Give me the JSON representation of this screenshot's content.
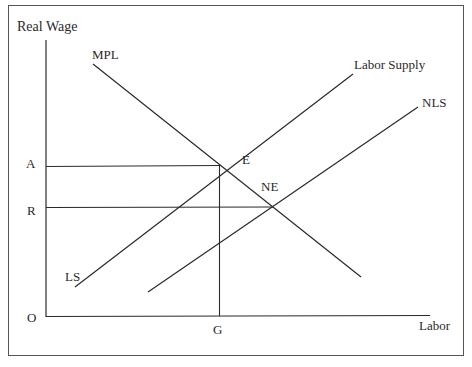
{
  "diagram": {
    "type": "labor-market supply-demand diagram",
    "axes": {
      "y_label": "Real Wage",
      "x_label": "Labor",
      "origin_label": "O"
    },
    "curves": [
      {
        "name": "MPL",
        "label": "MPL",
        "description": "marginal product of labor (labor demand), downward sloping"
      },
      {
        "name": "Labor Supply",
        "label": "Labor Supply",
        "end_label": "LS",
        "description": "original labor supply, upward sloping"
      },
      {
        "name": "NLS",
        "label": "NLS",
        "description": "new labor supply, shifted right"
      }
    ],
    "points": [
      {
        "label": "E",
        "description": "equilibrium of MPL and Labor Supply"
      },
      {
        "label": "NE",
        "description": "new equilibrium of MPL and NLS"
      }
    ],
    "y_markers": [
      {
        "label": "A",
        "description": "wage at E"
      },
      {
        "label": "R",
        "description": "wage at NE"
      }
    ],
    "x_markers": [
      {
        "label": "G",
        "description": "labor quantity at E"
      }
    ],
    "colors": {
      "line": "#2a2a2a",
      "frame": "#555555",
      "background": "#ffffff"
    }
  }
}
